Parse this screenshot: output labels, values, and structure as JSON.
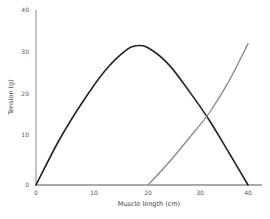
{
  "chart_data": {
    "type": "line",
    "title": "",
    "xlabel": "Muscle length (cm)",
    "ylabel": "Tension (g)",
    "xlim": [
      0,
      40
    ],
    "ylim": [
      0,
      40
    ],
    "x_ticks": [
      "0",
      "10",
      "20",
      "30",
      "40"
    ],
    "y_ticks": [
      "0",
      "10",
      "20",
      "30",
      "40"
    ],
    "grid": false,
    "legend": null,
    "series": [
      {
        "name": "Active tension",
        "color": "#222222",
        "x": [
          0,
          4,
          8,
          12,
          16,
          18,
          20,
          24,
          28,
          32,
          36,
          40
        ],
        "values": [
          0,
          9,
          18,
          25.5,
          30.5,
          31.5,
          31,
          27,
          20.5,
          13.5,
          6.5,
          0
        ]
      },
      {
        "name": "Passive tension",
        "color": "#888888",
        "x": [
          20,
          24,
          28,
          32,
          36,
          40
        ],
        "values": [
          0,
          4.5,
          9.5,
          15.5,
          23,
          32
        ]
      }
    ]
  }
}
